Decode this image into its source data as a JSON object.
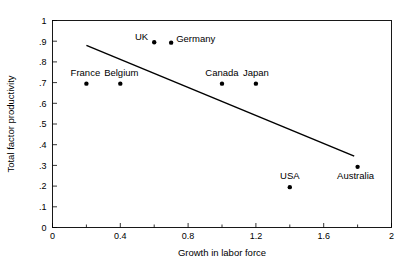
{
  "chart_data": {
    "type": "scatter",
    "title": "",
    "xlabel": "Growth in labor force",
    "ylabel": "Total factor productivity",
    "xlim": [
      0,
      2
    ],
    "ylim": [
      0,
      1
    ],
    "grid": false,
    "legend": "none",
    "x_ticks": [
      0,
      0.2,
      0.4,
      0.6,
      0.8,
      1.0,
      1.2,
      1.4,
      1.6,
      1.8,
      2.0
    ],
    "x_tick_labels": [
      "0",
      "",
      "0.4",
      "",
      "0.8",
      "",
      "1.2",
      "",
      "1.6",
      "",
      "2"
    ],
    "y_ticks": [
      0,
      0.1,
      0.2,
      0.3,
      0.4,
      0.5,
      0.6,
      0.7,
      0.8,
      0.9,
      1.0
    ],
    "y_tick_labels": [
      "0",
      ".1",
      ".2",
      ".3",
      ".4",
      ".5",
      ".6",
      ".7",
      ".8",
      ".9",
      "1"
    ],
    "points": [
      {
        "label": "France",
        "x": 0.2,
        "y": 0.695,
        "label_dx": -1,
        "label_dy": -8,
        "anchor": "middle"
      },
      {
        "label": "Belgium",
        "x": 0.4,
        "y": 0.695,
        "label_dx": 1,
        "label_dy": -8,
        "anchor": "middle"
      },
      {
        "label": "UK",
        "x": 0.6,
        "y": 0.895,
        "label_dx": -6,
        "label_dy": -2,
        "anchor": "end"
      },
      {
        "label": "Germany",
        "x": 0.7,
        "y": 0.893,
        "label_dx": 5,
        "label_dy": -1,
        "anchor": "start"
      },
      {
        "label": "Canada",
        "x": 1.0,
        "y": 0.695,
        "label_dx": 0,
        "label_dy": -8,
        "anchor": "middle"
      },
      {
        "label": "Japan",
        "x": 1.2,
        "y": 0.695,
        "label_dx": 0,
        "label_dy": -8,
        "anchor": "middle"
      },
      {
        "label": "USA",
        "x": 1.4,
        "y": 0.195,
        "label_dx": 0,
        "label_dy": -8,
        "anchor": "middle"
      },
      {
        "label": "Australia",
        "x": 1.8,
        "y": 0.293,
        "label_dx": -2,
        "label_dy": 12,
        "anchor": "middle"
      }
    ],
    "trend_line": {
      "x0": 0.2,
      "y0": 0.88,
      "x1": 1.78,
      "y1": 0.345
    }
  }
}
